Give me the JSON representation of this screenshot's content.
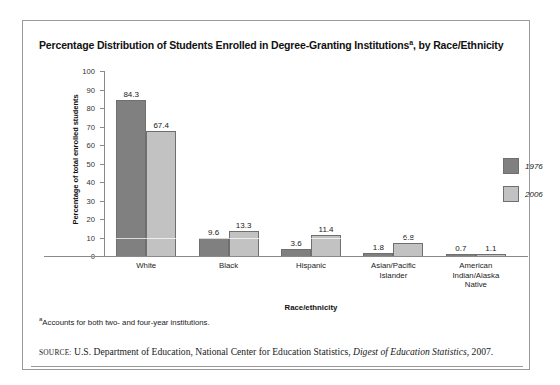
{
  "figure": {
    "title_main": "Percentage Distribution of Students Enrolled in Degree-Granting Institutions",
    "title_superscript": "a",
    "title_tail": ", by Race/Ethnicity",
    "footnote_marker": "a",
    "footnote_text": "Accounts for both two- and four-year institutions.",
    "source_label": "Source:",
    "source_text": "U.S. Department of Education, National Center for Education Statistics, ",
    "source_italic": "Digest of Education Statistics",
    "source_tail": ", 2007."
  },
  "legend": {
    "items": [
      {
        "label": "1976",
        "color": "#808080"
      },
      {
        "label": "2006",
        "color": "#c2c2c2"
      }
    ]
  },
  "chart_data": {
    "type": "bar",
    "xlabel": "Race/ethnicity",
    "ylabel": "Percentage of total enrolled students",
    "ylim": [
      0,
      100
    ],
    "ytick_step": 10,
    "yticks": [
      "100",
      "90",
      "80",
      "70",
      "60",
      "50",
      "40",
      "30",
      "20",
      "10",
      "0"
    ],
    "grid": false,
    "legend_position": "right",
    "categories": [
      "White",
      "Black",
      "Hispanic",
      "Asian/Pacific Islander",
      "American Indian/Alaska Native"
    ],
    "category_lines": [
      [
        "White"
      ],
      [
        "Black"
      ],
      [
        "Hispanic"
      ],
      [
        "Asian/Pacific",
        "Islander"
      ],
      [
        "American",
        "Indian/Alaska",
        "Native"
      ]
    ],
    "series": [
      {
        "name": "1976",
        "color": "#808080",
        "values": [
          84.3,
          9.6,
          3.6,
          1.8,
          0.7
        ]
      },
      {
        "name": "2006",
        "color": "#c2c2c2",
        "values": [
          67.4,
          13.3,
          11.4,
          6.8,
          1.1
        ]
      }
    ]
  }
}
